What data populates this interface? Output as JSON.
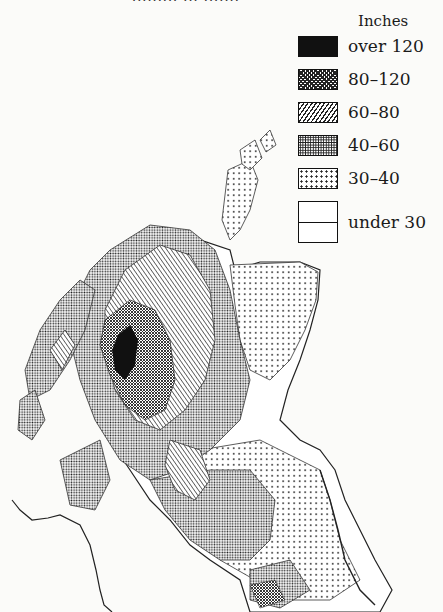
{
  "page": {
    "header_fragment": "········· ··· ·······"
  },
  "map": {
    "subject": "Annual rainfall of Scotland",
    "units": "Inches"
  },
  "legend": {
    "title": "Inches",
    "items": [
      {
        "label": "over 120",
        "pattern": "solid-black"
      },
      {
        "label": "80–120",
        "pattern": "dense-crosshatch"
      },
      {
        "label": "60–80",
        "pattern": "diagonal-lines"
      },
      {
        "label": "40–60",
        "pattern": "fine-dots"
      },
      {
        "label": "30–40",
        "pattern": "sparse-dots"
      },
      {
        "label": "under 30",
        "pattern": "blank"
      }
    ]
  },
  "colors": {
    "ink": "#111111",
    "paper": "#fbfbf9"
  }
}
